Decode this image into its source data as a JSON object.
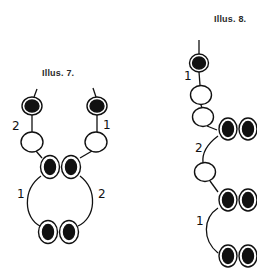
{
  "figures": [
    {
      "title": "Illus. 7.",
      "labels": {
        "top_left": "2",
        "top_right": "1",
        "circle_left": "1",
        "circle_right": "2"
      },
      "description": "Two strands each starting with a black bead and a white bead, joining into a pair of black beads, forming a ring closed with another pair of black beads"
    },
    {
      "title": "Illus. 8.",
      "labels": {
        "first": "1",
        "second": "2",
        "third": "1"
      },
      "description": "Single strand: black bead, two white beads, pair of black beads, arc with white bead to second pair, arc to third pair"
    }
  ],
  "colors": {
    "ink": "#111111",
    "bead_fill_dark": "#111111",
    "bead_fill_light": "#ffffff",
    "background": "#ffffff"
  }
}
